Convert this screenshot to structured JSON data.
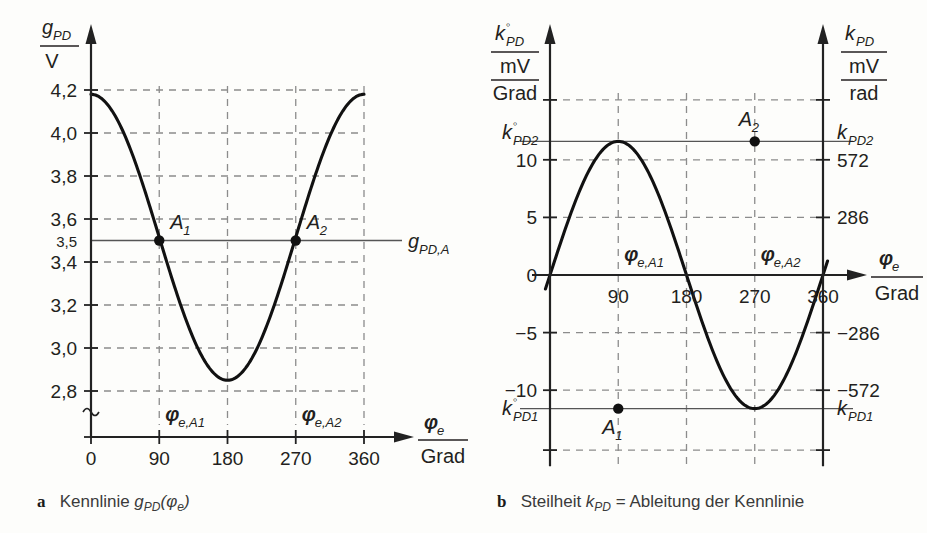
{
  "figure": {
    "panels": [
      {
        "id": "a",
        "letter": "a",
        "caption_prefix": "Kennlinie ",
        "caption_symbol": "g",
        "caption_sub": "PD",
        "caption_suffix": "(φ",
        "caption_sub2": "e",
        "caption_tail": ")"
      },
      {
        "id": "b",
        "letter": "b",
        "caption_prefix": "Steilheit ",
        "caption_symbol": "k",
        "caption_sub": "PD",
        "caption_suffix": " = Ableitung der Kennlinie",
        "caption_sub2": "",
        "caption_tail": ""
      }
    ]
  },
  "chart_data": [
    {
      "type": "line",
      "id": "kennlinie",
      "title": "Kennlinie g_PD(phi_e)",
      "ylabel_symbol": "g",
      "ylabel_sub": "PD",
      "ylabel_unit": "V",
      "xlabel_symbol": "φ",
      "xlabel_sub": "e",
      "xlabel_unit": "Grad",
      "xlim": [
        0,
        360
      ],
      "ylim": [
        2.74,
        4.26
      ],
      "x_ticks": [
        "0",
        "90",
        "180",
        "270",
        "360"
      ],
      "x_tick_values": [
        0,
        90,
        180,
        270,
        360
      ],
      "y_ticks": [
        "4,2",
        "4,0",
        "3,8",
        "3,6",
        "3,4",
        "3,2",
        "3,0",
        "2,8"
      ],
      "y_tick_values": [
        4.2,
        4.0,
        3.8,
        3.6,
        3.4,
        3.2,
        3.0,
        2.8
      ],
      "y_extra_ticks": [
        "3,5"
      ],
      "y_extra_tick_values": [
        3.5
      ],
      "grid": "dashed",
      "axis_break": true,
      "curve": {
        "form": "cosine",
        "amplitude": 0.665,
        "offset": 3.515,
        "period_deg": 360,
        "max": 4.18,
        "min": 2.85,
        "max_at_deg": [
          0,
          360
        ],
        "min_at_deg": [
          180
        ]
      },
      "reference_line": {
        "value": 3.5,
        "label_symbol": "g",
        "label_sub": "PD,A"
      },
      "markers": [
        {
          "name": "A",
          "index": "1",
          "x": 90,
          "y": 3.5,
          "label": "A₁"
        },
        {
          "name": "A",
          "index": "2",
          "x": 270,
          "y": 3.5,
          "label": "A₂"
        }
      ],
      "vline_annotations": [
        {
          "symbol": "φ",
          "sub": "e,A1",
          "x": 90
        },
        {
          "symbol": "φ",
          "sub": "e,A2",
          "x": 270
        }
      ]
    },
    {
      "type": "line",
      "id": "steilheit",
      "title": "Steilheit k_PD = Ableitung der Kennlinie",
      "ylabel_symbol": "k",
      "ylabel_sub": "PD",
      "ylabel_sup": "◦",
      "ylabel_unit_num": "mV",
      "ylabel_unit_den": "Grad",
      "ylabel2_symbol": "k",
      "ylabel2_sub": "PD",
      "ylabel2_unit_num": "mV",
      "ylabel2_unit_den": "rad",
      "xlabel_symbol": "φ",
      "xlabel_sub": "e",
      "xlabel_unit": "Grad",
      "xlim": [
        0,
        360
      ],
      "ylim": [
        -15.6,
        15.6
      ],
      "x_ticks": [
        "90",
        "180",
        "270",
        "360"
      ],
      "x_tick_values": [
        90,
        180,
        270,
        360
      ],
      "y_ticks": [
        "10",
        "5",
        "0",
        "−5",
        "−10"
      ],
      "y_tick_values": [
        10,
        5,
        0,
        -5,
        -10
      ],
      "y_ticks_right": [
        "572",
        "286",
        "−286",
        "−572"
      ],
      "y_tick_values_right": [
        10,
        5,
        -5,
        -10
      ],
      "grid": "dashed",
      "curve": {
        "form": "sine",
        "amplitude": 11.6,
        "offset": 0,
        "period_deg": 360,
        "max": 11.6,
        "min": -11.6,
        "max_at_deg": [
          270
        ],
        "min_at_deg": [
          90
        ],
        "zero_at_deg": [
          0,
          180,
          360
        ]
      },
      "reference_lines": [
        {
          "value": 11.6,
          "label_symbol": "k",
          "label_sub": "PD2",
          "label_sup": "◦",
          "label_right_symbol": "k",
          "label_right_sub": "PD2"
        },
        {
          "value": -11.6,
          "label_symbol": "k",
          "label_sub": "PD1",
          "label_sup": "◦",
          "label_right_symbol": "k",
          "label_right_sub": "PD1"
        }
      ],
      "markers": [
        {
          "name": "A",
          "index": "1",
          "x": 90,
          "y": -11.6,
          "label": "A₁"
        },
        {
          "name": "A",
          "index": "2",
          "x": 270,
          "y": 11.6,
          "label": "A₂"
        }
      ],
      "vline_annotations": [
        {
          "symbol": "φ",
          "sub": "e,A1",
          "x": 90
        },
        {
          "symbol": "φ",
          "sub": "e,A2",
          "x": 270
        }
      ],
      "extra_gridlines": [
        15.2,
        -15.2
      ]
    }
  ],
  "colors": {
    "curve": "#111111",
    "axis": "#222222",
    "grid": "#8c8c8c",
    "reference": "#555555",
    "text": "#231f20",
    "background": "#fdfdfb"
  }
}
